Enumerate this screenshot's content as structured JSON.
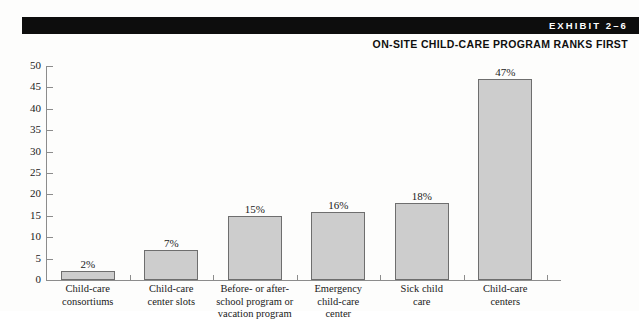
{
  "header": {
    "exhibit_label": "EXHIBIT 2–6",
    "subtitle": "ON-SITE CHILD-CARE PROGRAM RANKS FIRST",
    "bar_color": "#0d0d0d"
  },
  "chart_data": {
    "type": "bar",
    "title": "ON-SITE CHILD-CARE PROGRAM RANKS FIRST",
    "xlabel": "",
    "ylabel": "",
    "ylim": [
      0,
      50
    ],
    "ytick_step": 5,
    "grid": false,
    "legend": "none",
    "bar_fill": "#cdcdcd",
    "bar_border": "#6e6e6e",
    "yticks": [
      "0",
      "5",
      "10",
      "15",
      "20",
      "25",
      "30",
      "35",
      "40",
      "45",
      "50"
    ],
    "categories": [
      [
        "Child-care",
        "consortiums"
      ],
      [
        "Child-care",
        "center slots"
      ],
      [
        "Before- or after-",
        "school program or",
        "vacation program"
      ],
      [
        "Emergency",
        "child-care",
        "center"
      ],
      [
        "Sick child",
        "care"
      ],
      [
        "Child-care",
        "centers"
      ]
    ],
    "values": [
      2,
      7,
      15,
      16,
      18,
      47
    ],
    "data_labels": [
      "2%",
      "7%",
      "15%",
      "16%",
      "18%",
      "47%"
    ]
  }
}
